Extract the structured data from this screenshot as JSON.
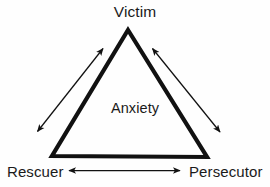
{
  "diagram": {
    "name": "drama-triangle",
    "type": "triangle-relationship-diagram",
    "background_color": "#fefefe",
    "stroke_color": "#111111",
    "text_color": "#1a1a1a",
    "center_label": "Anxiety",
    "vertices": [
      {
        "id": "victim",
        "label": "Victim",
        "position": "top",
        "x": 128,
        "y": 30
      },
      {
        "id": "rescuer",
        "label": "Rescuer",
        "position": "bottom-left",
        "x": 52,
        "y": 156
      },
      {
        "id": "persecutor",
        "label": "Persecutor",
        "position": "bottom-right",
        "x": 207,
        "y": 157
      }
    ],
    "edges": [
      {
        "id": "rescuer-victim",
        "from": "Rescuer",
        "to": "Victim",
        "arrow": "double"
      },
      {
        "id": "victim-persecutor",
        "from": "Victim",
        "to": "Persecutor",
        "arrow": "double"
      },
      {
        "id": "rescuer-persecutor",
        "from": "Rescuer",
        "to": "Persecutor",
        "arrow": "double"
      }
    ]
  }
}
